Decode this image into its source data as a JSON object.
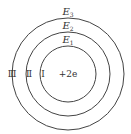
{
  "diagram": {
    "levels": [
      {
        "energy_label": "E",
        "subscript": "1",
        "region_label": "Ⅰ"
      },
      {
        "energy_label": "E",
        "subscript": "2",
        "region_label": "Ⅱ"
      },
      {
        "energy_label": "E",
        "subscript": "3",
        "region_label": "Ⅲ"
      }
    ],
    "center_charge": "+2e",
    "line_color": "#444444"
  }
}
